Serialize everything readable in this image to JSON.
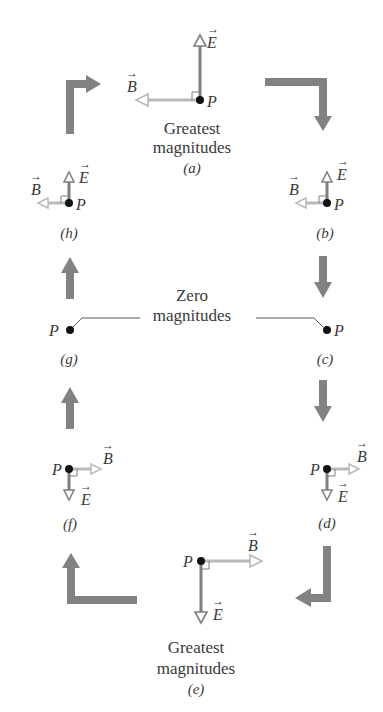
{
  "diagram": {
    "colors": {
      "e_field": "#7f7f7f",
      "b_field": "#b9b9b9",
      "flow_arrow": "#828282",
      "dot": "#111111",
      "text": "#3a3a3a"
    },
    "labels": {
      "point": "P",
      "e_vector": "E",
      "b_vector": "B",
      "greatest_line1": "Greatest",
      "greatest_line2": "magnitudes",
      "zero_line1": "Zero",
      "zero_line2": "magnitudes"
    },
    "panels": [
      {
        "id": "a",
        "caption": "(a)",
        "state": "greatest",
        "E": "up",
        "B": "left"
      },
      {
        "id": "b",
        "caption": "(b)",
        "state": "small",
        "E": "up",
        "B": "left"
      },
      {
        "id": "c",
        "caption": "(c)",
        "state": "zero"
      },
      {
        "id": "d",
        "caption": "(d)",
        "state": "small",
        "E": "down",
        "B": "right"
      },
      {
        "id": "e",
        "caption": "(e)",
        "state": "greatest",
        "E": "down",
        "B": "right"
      },
      {
        "id": "f",
        "caption": "(f)",
        "state": "small",
        "E": "down",
        "B": "right"
      },
      {
        "id": "g",
        "caption": "(g)",
        "state": "zero"
      },
      {
        "id": "h",
        "caption": "(h)",
        "state": "small",
        "E": "up",
        "B": "left"
      }
    ],
    "flow": "clockwise a → b → c → d → e → f → g → h → a"
  }
}
